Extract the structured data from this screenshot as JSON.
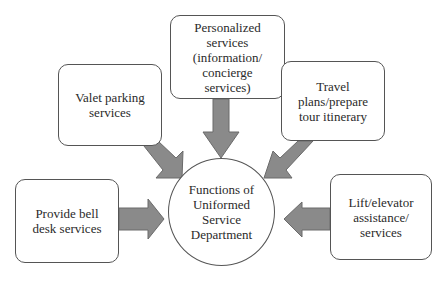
{
  "diagram": {
    "center": {
      "label": "Functions of\nUniformed\nService\nDepartment"
    },
    "nodes": [
      {
        "id": "personalized",
        "label": "Personalized\nservices\n(information/\nconcierge\nservices)"
      },
      {
        "id": "valet",
        "label": "Valet parking\nservices"
      },
      {
        "id": "travel",
        "label": "Travel\nplans/prepare\ntour itinerary"
      },
      {
        "id": "bell-desk",
        "label": "Provide bell\ndesk services"
      },
      {
        "id": "lift",
        "label": "Lift/elevator\nassistance/\nservices"
      }
    ],
    "colors": {
      "arrow_fill": "#8a8a8a",
      "arrow_stroke": "#6a6a6a",
      "border": "#555555"
    }
  }
}
